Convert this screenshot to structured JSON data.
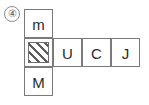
{
  "figure": {
    "item_number": "④",
    "grid": {
      "shape": "cross",
      "cells": {
        "top": "m",
        "middle_0": "",
        "middle_1": "U",
        "middle_2": "C",
        "middle_3": "J",
        "bottom": "M"
      },
      "shaded_cell": {
        "position": "middle_0",
        "fill": "diagonal-hatch",
        "hatch_direction": "forward-slash",
        "hatch_color": "#5d5d5d"
      }
    },
    "colors": {
      "background": "#ffffff",
      "cell_border": "#7a7a7a",
      "text": "#2b2b2b",
      "marker_border": "#8d8d8d",
      "marker_text": "#555555"
    }
  }
}
